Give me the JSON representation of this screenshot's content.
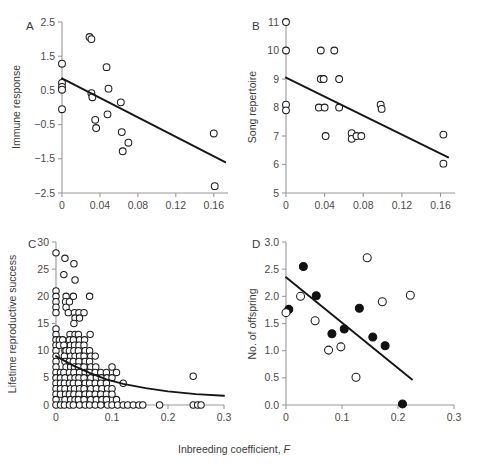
{
  "figure": {
    "shared_xlabel_text": "Inbreeding coefficient, ",
    "shared_xlabel_italic": "F"
  },
  "chart_data": [
    {
      "type": "scatter",
      "panel": "A",
      "title": "",
      "xlabel": "Inbreeding coefficient, F",
      "ylabel": "Immune response",
      "xlim": [
        0,
        0.175
      ],
      "ylim": [
        -2.5,
        2.5
      ],
      "xticks": [
        0,
        0.04,
        0.08,
        0.12,
        0.16
      ],
      "xticklabels": [
        "0",
        "0.04",
        "0.08",
        "0.12",
        "0.16"
      ],
      "yticks": [
        -2.5,
        -1.5,
        -0.5,
        0.5,
        1.5,
        2.5
      ],
      "yticklabels": [
        "-2.5",
        "-1.5",
        "-0.5",
        "0.5",
        "1.5",
        "2.5"
      ],
      "grid": false,
      "legend": "none",
      "marker": "open-circle",
      "points": [
        [
          0.0,
          1.28
        ],
        [
          0.0,
          0.72
        ],
        [
          0.0,
          0.6
        ],
        [
          0.0,
          0.52
        ],
        [
          0.0,
          -0.05
        ],
        [
          0.029,
          2.06
        ],
        [
          0.031,
          2.0
        ],
        [
          0.031,
          0.42
        ],
        [
          0.032,
          0.3
        ],
        [
          0.035,
          -0.36
        ],
        [
          0.036,
          -0.6
        ],
        [
          0.047,
          1.18
        ],
        [
          0.049,
          0.55
        ],
        [
          0.048,
          -0.2
        ],
        [
          0.062,
          0.15
        ],
        [
          0.063,
          -0.72
        ],
        [
          0.064,
          -1.28
        ],
        [
          0.07,
          -1.03
        ],
        [
          0.16,
          -0.76
        ],
        [
          0.161,
          -2.3
        ]
      ],
      "fit": {
        "type": "linear",
        "x0": 0.0,
        "y0": 0.85,
        "x1": 0.172,
        "y1": -1.6
      }
    },
    {
      "type": "scatter",
      "panel": "B",
      "title": "",
      "xlabel": "Inbreeding coefficient, F",
      "ylabel": "Song repertoire",
      "xlim": [
        0,
        0.175
      ],
      "ylim": [
        5,
        11
      ],
      "xticks": [
        0,
        0.04,
        0.08,
        0.12,
        0.16
      ],
      "xticklabels": [
        "0",
        "0.04",
        "0.08",
        "0.12",
        "0.16"
      ],
      "yticks": [
        5,
        6,
        7,
        8,
        9,
        10,
        11
      ],
      "yticklabels": [
        "5",
        "6",
        "7",
        "8",
        "9",
        "10",
        "11"
      ],
      "grid": false,
      "legend": "none",
      "marker": "open-circle",
      "points": [
        [
          0.0,
          11.0
        ],
        [
          0.0,
          10.0
        ],
        [
          0.0,
          8.1
        ],
        [
          0.0,
          7.9
        ],
        [
          0.036,
          10.0
        ],
        [
          0.05,
          10.0
        ],
        [
          0.036,
          9.0
        ],
        [
          0.039,
          9.0
        ],
        [
          0.055,
          9.0
        ],
        [
          0.034,
          8.0
        ],
        [
          0.04,
          8.0
        ],
        [
          0.055,
          8.0
        ],
        [
          0.098,
          8.1
        ],
        [
          0.099,
          7.95
        ],
        [
          0.041,
          7.0
        ],
        [
          0.068,
          7.1
        ],
        [
          0.068,
          6.9
        ],
        [
          0.073,
          7.0
        ],
        [
          0.078,
          7.0
        ],
        [
          0.163,
          7.05
        ],
        [
          0.163,
          6.03
        ]
      ],
      "fit": {
        "type": "linear",
        "x0": 0.0,
        "y0": 9.05,
        "x1": 0.168,
        "y1": 6.25
      }
    },
    {
      "type": "scatter",
      "panel": "C",
      "title": "",
      "xlabel": "Inbreeding coefficient, F",
      "ylabel": "Lifetime reproductive success",
      "xlim": [
        0,
        0.3
      ],
      "ylim": [
        0,
        30
      ],
      "xticks": [
        0,
        0.1,
        0.2,
        0.3
      ],
      "xticklabels": [
        "0",
        "0.1",
        "0.2",
        "0.3"
      ],
      "yticks": [
        0,
        5,
        10,
        15,
        20,
        25,
        30
      ],
      "yticklabels": [
        "0",
        "5",
        "10",
        "15",
        "20",
        "25",
        "30"
      ],
      "grid": false,
      "legend": "none",
      "marker": "open-circle",
      "points": [
        [
          0.0,
          28
        ],
        [
          0.0,
          21
        ],
        [
          0.0,
          20
        ],
        [
          0.0,
          19
        ],
        [
          0.0,
          18
        ],
        [
          0.0,
          17
        ],
        [
          0.0,
          14
        ],
        [
          0.0,
          13
        ],
        [
          0.0,
          12
        ],
        [
          0.0,
          11
        ],
        [
          0.0,
          10
        ],
        [
          0.0,
          9
        ],
        [
          0.0,
          8
        ],
        [
          0.0,
          7
        ],
        [
          0.0,
          6
        ],
        [
          0.0,
          5
        ],
        [
          0.0,
          4
        ],
        [
          0.0,
          3
        ],
        [
          0.0,
          2
        ],
        [
          0.0,
          1
        ],
        [
          0.0,
          0
        ],
        [
          0.006,
          12
        ],
        [
          0.006,
          11
        ],
        [
          0.008,
          6
        ],
        [
          0.008,
          5
        ],
        [
          0.008,
          4
        ],
        [
          0.008,
          3
        ],
        [
          0.008,
          2
        ],
        [
          0.008,
          0
        ],
        [
          0.016,
          27
        ],
        [
          0.014,
          24
        ],
        [
          0.018,
          20
        ],
        [
          0.017,
          19
        ],
        [
          0.018,
          18
        ],
        [
          0.012,
          12
        ],
        [
          0.014,
          11
        ],
        [
          0.016,
          10
        ],
        [
          0.018,
          10
        ],
        [
          0.015,
          9
        ],
        [
          0.016,
          8
        ],
        [
          0.018,
          7
        ],
        [
          0.014,
          6
        ],
        [
          0.016,
          5
        ],
        [
          0.015,
          4
        ],
        [
          0.016,
          3
        ],
        [
          0.017,
          2
        ],
        [
          0.016,
          1
        ],
        [
          0.015,
          0
        ],
        [
          0.024,
          19
        ],
        [
          0.022,
          17
        ],
        [
          0.025,
          13
        ],
        [
          0.024,
          12
        ],
        [
          0.026,
          11
        ],
        [
          0.024,
          10
        ],
        [
          0.026,
          9
        ],
        [
          0.024,
          8
        ],
        [
          0.026,
          7
        ],
        [
          0.024,
          6
        ],
        [
          0.026,
          5
        ],
        [
          0.024,
          4
        ],
        [
          0.026,
          3
        ],
        [
          0.024,
          2
        ],
        [
          0.026,
          1
        ],
        [
          0.024,
          0
        ],
        [
          0.032,
          26
        ],
        [
          0.034,
          23
        ],
        [
          0.031,
          20
        ],
        [
          0.033,
          17
        ],
        [
          0.034,
          16
        ],
        [
          0.032,
          15
        ],
        [
          0.034,
          13
        ],
        [
          0.031,
          12
        ],
        [
          0.033,
          11
        ],
        [
          0.032,
          10
        ],
        [
          0.034,
          9
        ],
        [
          0.031,
          8
        ],
        [
          0.033,
          7
        ],
        [
          0.032,
          6
        ],
        [
          0.034,
          5
        ],
        [
          0.031,
          4
        ],
        [
          0.033,
          3
        ],
        [
          0.032,
          2
        ],
        [
          0.034,
          1
        ],
        [
          0.031,
          0
        ],
        [
          0.041,
          17
        ],
        [
          0.042,
          16
        ],
        [
          0.04,
          13
        ],
        [
          0.042,
          12
        ],
        [
          0.041,
          11
        ],
        [
          0.04,
          10
        ],
        [
          0.042,
          9
        ],
        [
          0.041,
          8
        ],
        [
          0.04,
          7
        ],
        [
          0.042,
          6
        ],
        [
          0.041,
          5
        ],
        [
          0.04,
          4
        ],
        [
          0.042,
          3
        ],
        [
          0.041,
          2
        ],
        [
          0.04,
          1
        ],
        [
          0.042,
          0
        ],
        [
          0.05,
          17
        ],
        [
          0.051,
          12
        ],
        [
          0.05,
          11
        ],
        [
          0.052,
          10
        ],
        [
          0.05,
          9
        ],
        [
          0.052,
          8
        ],
        [
          0.05,
          7
        ],
        [
          0.052,
          6
        ],
        [
          0.05,
          5
        ],
        [
          0.052,
          4
        ],
        [
          0.05,
          3
        ],
        [
          0.052,
          2
        ],
        [
          0.05,
          1
        ],
        [
          0.052,
          0
        ],
        [
          0.06,
          20
        ],
        [
          0.061,
          13
        ],
        [
          0.06,
          10
        ],
        [
          0.062,
          9
        ],
        [
          0.06,
          8
        ],
        [
          0.062,
          7
        ],
        [
          0.06,
          6
        ],
        [
          0.062,
          5
        ],
        [
          0.06,
          4
        ],
        [
          0.062,
          3
        ],
        [
          0.06,
          2
        ],
        [
          0.062,
          1
        ],
        [
          0.06,
          0
        ],
        [
          0.07,
          9
        ],
        [
          0.071,
          7
        ],
        [
          0.07,
          6
        ],
        [
          0.072,
          5
        ],
        [
          0.07,
          4
        ],
        [
          0.072,
          3
        ],
        [
          0.07,
          2
        ],
        [
          0.072,
          1
        ],
        [
          0.07,
          0
        ],
        [
          0.08,
          6
        ],
        [
          0.081,
          5
        ],
        [
          0.08,
          4
        ],
        [
          0.082,
          3
        ],
        [
          0.08,
          2
        ],
        [
          0.082,
          1
        ],
        [
          0.08,
          0
        ],
        [
          0.09,
          6
        ],
        [
          0.091,
          5
        ],
        [
          0.09,
          4
        ],
        [
          0.092,
          3
        ],
        [
          0.09,
          2
        ],
        [
          0.09,
          1
        ],
        [
          0.092,
          0
        ],
        [
          0.1,
          7
        ],
        [
          0.1,
          5
        ],
        [
          0.1,
          3
        ],
        [
          0.1,
          2
        ],
        [
          0.1,
          0
        ],
        [
          0.108,
          6
        ],
        [
          0.108,
          1
        ],
        [
          0.11,
          0
        ],
        [
          0.12,
          4
        ],
        [
          0.12,
          0
        ],
        [
          0.128,
          0
        ],
        [
          0.138,
          0
        ],
        [
          0.148,
          0
        ],
        [
          0.155,
          0
        ],
        [
          0.185,
          0
        ],
        [
          0.245,
          0
        ],
        [
          0.253,
          0
        ],
        [
          0.259,
          0
        ],
        [
          0.245,
          5.3
        ]
      ],
      "fit": {
        "type": "curve",
        "points": [
          [
            0.0,
            9.0
          ],
          [
            0.03,
            7.3
          ],
          [
            0.06,
            5.9
          ],
          [
            0.09,
            4.7
          ],
          [
            0.12,
            3.9
          ],
          [
            0.16,
            3.1
          ],
          [
            0.2,
            2.5
          ],
          [
            0.25,
            2.0
          ],
          [
            0.3,
            1.7
          ]
        ]
      }
    },
    {
      "type": "scatter",
      "panel": "D",
      "title": "",
      "xlabel": "Inbreeding coefficient, F",
      "ylabel": "No. of offspring",
      "xlim": [
        0,
        0.3
      ],
      "ylim": [
        0,
        3.0
      ],
      "xticks": [
        0,
        0.1,
        0.2,
        0.3
      ],
      "xticklabels": [
        "0",
        "0.1",
        "0.2",
        "0.3"
      ],
      "yticks": [
        0,
        0.5,
        1.0,
        1.5,
        2.0,
        2.5,
        3.0
      ],
      "yticklabels": [
        "0.0",
        "0.5",
        "1.0",
        "1.5",
        "2.0",
        "2.5",
        "3.0"
      ],
      "grid": false,
      "legend": "none",
      "series": [
        {
          "name": "filled",
          "marker": "filled-circle",
          "values": [
            [
              0.005,
              1.76
            ],
            [
              0.031,
              2.55
            ],
            [
              0.054,
              2.01
            ],
            [
              0.082,
              1.31
            ],
            [
              0.104,
              1.4
            ],
            [
              0.131,
              1.78
            ],
            [
              0.155,
              1.25
            ],
            [
              0.177,
              1.09
            ],
            [
              0.208,
              0.02
            ]
          ]
        },
        {
          "name": "open",
          "marker": "open-circle",
          "values": [
            [
              0.0,
              1.7
            ],
            [
              0.026,
              2.0
            ],
            [
              0.052,
              1.55
            ],
            [
              0.076,
              1.01
            ],
            [
              0.098,
              1.07
            ],
            [
              0.125,
              0.51
            ],
            [
              0.145,
              2.71
            ],
            [
              0.172,
              1.9
            ],
            [
              0.222,
              2.02
            ]
          ]
        }
      ],
      "fit": {
        "type": "linear",
        "x0": 0.0,
        "y0": 2.35,
        "x1": 0.225,
        "y1": 0.47
      }
    }
  ]
}
